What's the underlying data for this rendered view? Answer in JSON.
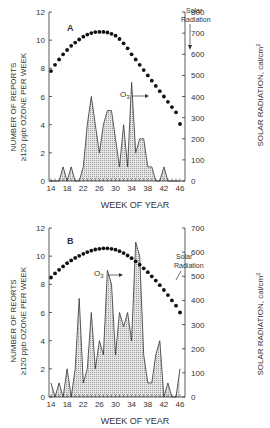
{
  "chart_data": [
    {
      "type": "area",
      "panel_label": "A",
      "title": "",
      "xlabel": "WEEK OF YEAR",
      "ylabel": "NUMBER OF REPORTS ≥120 ppb OZONE PER WEEK",
      "y2label": "SOLAR RADIATION, cal/cm²",
      "xlim": [
        14,
        46
      ],
      "ylim": [
        0,
        12
      ],
      "y2lim": [
        0,
        800
      ],
      "x_ticks": [
        14,
        18,
        22,
        26,
        30,
        34,
        38,
        42,
        46
      ],
      "y_ticks": [
        0,
        2,
        4,
        6,
        8,
        10,
        12
      ],
      "y2_ticks": [
        0,
        100,
        200,
        300,
        400,
        500,
        600,
        700,
        800
      ],
      "grid": false,
      "annotations": [
        {
          "text": "O3",
          "target": "ozone peak near week 34"
        },
        {
          "text": "Solar Radiation",
          "target": "solar curve near week 34"
        }
      ],
      "series": [
        {
          "name": "O3",
          "axis": "left",
          "style": "filled-hatched-area",
          "x": [
            14,
            15,
            16,
            17,
            18,
            19,
            20,
            21,
            22,
            23,
            24,
            25,
            26,
            27,
            28,
            29,
            30,
            31,
            32,
            33,
            34,
            35,
            36,
            37,
            38,
            39,
            40,
            41,
            42,
            43,
            44,
            45,
            46
          ],
          "values": [
            0,
            0,
            0,
            1,
            0,
            1,
            0,
            0,
            1,
            4,
            6,
            4,
            2,
            4,
            5,
            5,
            3,
            1,
            4,
            1,
            7,
            2,
            3,
            3,
            1,
            1,
            0,
            0,
            1,
            0,
            0,
            0,
            0
          ]
        },
        {
          "name": "Solar Radiation",
          "axis": "right",
          "style": "dotted-line",
          "x": [
            14,
            15,
            16,
            17,
            18,
            19,
            20,
            21,
            22,
            23,
            24,
            25,
            26,
            27,
            28,
            29,
            30,
            31,
            32,
            33,
            34,
            35,
            36,
            37,
            38,
            39,
            40,
            41,
            42,
            43,
            44,
            45,
            46
          ],
          "values": [
            520,
            550,
            575,
            600,
            620,
            640,
            655,
            670,
            683,
            693,
            700,
            705,
            706,
            706,
            703,
            697,
            688,
            672,
            652,
            628,
            600,
            575,
            550,
            525,
            500,
            475,
            450,
            425,
            400,
            375,
            350,
            325,
            270
          ]
        }
      ]
    },
    {
      "type": "area",
      "panel_label": "B",
      "title": "",
      "xlabel": "WEEK OF YEAR",
      "ylabel": "NUMBER OF REORTS ≥120 ppb OZONE PER WEEK",
      "y2label": "SOLAR RADIATION, cal/cm²",
      "xlim": [
        14,
        46
      ],
      "ylim": [
        0,
        12
      ],
      "y2lim": [
        0,
        700
      ],
      "x_ticks": [
        14,
        18,
        22,
        26,
        30,
        34,
        38,
        42,
        46
      ],
      "y_ticks": [
        0,
        2,
        4,
        6,
        8,
        10,
        12
      ],
      "y2_ticks": [
        0,
        100,
        200,
        300,
        400,
        500,
        600,
        700
      ],
      "grid": false,
      "annotations": [
        {
          "text": "O3",
          "target": "ozone peak near week 29"
        },
        {
          "text": "Solar Radiation",
          "target": "solar curve near week 36"
        }
      ],
      "series": [
        {
          "name": "O3",
          "axis": "left",
          "style": "filled-hatched-area",
          "x": [
            14,
            15,
            16,
            17,
            18,
            19,
            20,
            21,
            22,
            23,
            24,
            25,
            26,
            27,
            28,
            29,
            30,
            31,
            32,
            33,
            34,
            35,
            36,
            37,
            38,
            39,
            40,
            41,
            42,
            43,
            44,
            45,
            46
          ],
          "values": [
            1,
            0,
            1,
            0,
            2,
            0,
            2,
            7,
            1,
            2,
            6,
            2,
            4,
            3,
            9,
            8,
            3,
            6,
            5,
            6,
            4,
            11,
            10,
            3,
            1,
            1,
            3,
            4,
            0,
            1,
            0,
            0,
            2
          ]
        },
        {
          "name": "Solar Radiation",
          "axis": "right",
          "style": "dotted-line",
          "x": [
            14,
            15,
            16,
            17,
            18,
            19,
            20,
            21,
            22,
            23,
            24,
            25,
            26,
            27,
            28,
            29,
            30,
            31,
            32,
            33,
            34,
            35,
            36,
            37,
            38,
            39,
            40,
            41,
            42,
            43,
            44,
            45,
            46
          ],
          "values": [
            495,
            512,
            527,
            541,
            554,
            566,
            576,
            585,
            593,
            600,
            606,
            611,
            614,
            616,
            616,
            614,
            610,
            604,
            596,
            586,
            575,
            562,
            548,
            533,
            517,
            500,
            482,
            463,
            443,
            422,
            400,
            378,
            350
          ]
        }
      ]
    }
  ],
  "panels": {
    "A": {
      "label": "A",
      "xlabel": "WEEK OF YEAR",
      "ylabel_line1": "NUMBER OF REPORTS",
      "ylabel_line2": "≥120 ppb OZONE PER WEEK",
      "y2label": "SOLAR RADIATION, cal/cm",
      "y2label_sup": "2",
      "o3_label": "O",
      "o3_sub": "3",
      "solar_label_line1": "Solar",
      "solar_label_line2": "Radiation"
    },
    "B": {
      "label": "B",
      "xlabel": "WEEK OF YEAR",
      "ylabel_line1": "NUMBER OF REORTS",
      "ylabel_line2": "≥120 ppb OZONE PER WEEK",
      "y2label": "SOLAR RADIATION, cal/cm",
      "y2label_sup": "2",
      "o3_label": "O",
      "o3_sub": "3",
      "solar_label_line1": "Solar",
      "solar_label_line2": "Radiation"
    }
  }
}
